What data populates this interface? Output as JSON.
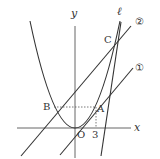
{
  "diagram": {
    "type": "coordinate-graph",
    "axes": {
      "x_label": "x",
      "y_label": "y",
      "origin_label": "O"
    },
    "tick_labels": {
      "x": "3"
    },
    "points": {
      "A": "A",
      "B": "B",
      "C": "C"
    },
    "lines": {
      "line1": "①",
      "line2": "②",
      "l": "ℓ"
    },
    "curve": "parabola",
    "colors": {
      "stroke": "#333333",
      "dashed": "#555555"
    }
  }
}
